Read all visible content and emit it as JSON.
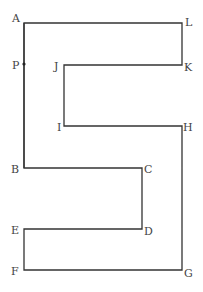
{
  "diagram": {
    "type": "polygon-outline",
    "stroke_color": "#333333",
    "background": "#ffffff",
    "vertices": [
      {
        "name": "A",
        "x": 24,
        "y": 23
      },
      {
        "name": "L",
        "x": 182,
        "y": 23
      },
      {
        "name": "K",
        "x": 182,
        "y": 65
      },
      {
        "name": "J",
        "x": 64,
        "y": 65
      },
      {
        "name": "I",
        "x": 64,
        "y": 126
      },
      {
        "name": "H",
        "x": 182,
        "y": 126
      },
      {
        "name": "G",
        "x": 182,
        "y": 270
      },
      {
        "name": "F",
        "x": 24,
        "y": 270
      },
      {
        "name": "E",
        "x": 24,
        "y": 229
      },
      {
        "name": "D",
        "x": 142,
        "y": 229
      },
      {
        "name": "C",
        "x": 142,
        "y": 168
      },
      {
        "name": "B",
        "x": 24,
        "y": 168
      }
    ],
    "point_on_edge": {
      "name": "P",
      "x": 24,
      "y": 64,
      "edge": "AB"
    },
    "labels": {
      "A": "A",
      "B": "B",
      "C": "C",
      "D": "D",
      "E": "E",
      "F": "F",
      "G": "G",
      "H": "H",
      "I": "I",
      "J": "J",
      "K": "K",
      "L": "L",
      "P": "P"
    }
  }
}
